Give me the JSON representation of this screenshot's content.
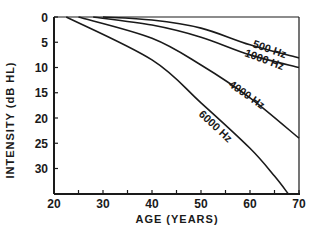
{
  "chart_data": {
    "type": "line",
    "title": "",
    "xlabel": "AGE (YEARS)",
    "ylabel": "INTENSITY (dB HL)",
    "xlim": [
      20,
      70
    ],
    "ylim": [
      0,
      35
    ],
    "y_inverted": true,
    "grid": false,
    "legend": "inline labels on curves",
    "x_ticks": [
      20,
      30,
      40,
      50,
      60,
      70
    ],
    "x_minor_ticks": [
      25,
      35,
      45,
      55,
      65
    ],
    "y_ticks": [
      0,
      5,
      10,
      15,
      20,
      25,
      30
    ],
    "series": [
      {
        "name": "500 Hz",
        "label": "500 Hz",
        "x": [
          30,
          40,
          50,
          60,
          70
        ],
        "y": [
          0,
          0.6,
          2.2,
          5.5,
          8.1
        ]
      },
      {
        "name": "1000 Hz",
        "label": "1000 Hz",
        "x": [
          28,
          40,
          50,
          60,
          70
        ],
        "y": [
          0,
          1.6,
          4.0,
          7.5,
          10.0
        ]
      },
      {
        "name": "4000 Hz",
        "label": "4000 Hz",
        "x": [
          25,
          40,
          50,
          60,
          70
        ],
        "y": [
          0,
          4.2,
          9.5,
          16.0,
          24.0
        ]
      },
      {
        "name": "6000 Hz",
        "label": "6000 Hz",
        "x": [
          22.5,
          40,
          50,
          60,
          65,
          67.8
        ],
        "y": [
          0,
          8.5,
          17.0,
          26.0,
          31.5,
          35.0
        ]
      }
    ]
  },
  "labels": {
    "x_axis_title": "AGE (YEARS)",
    "y_axis_title": "INTENSITY (dB HL)",
    "series": [
      "500 Hz",
      "1000 Hz",
      "4000 Hz",
      "6000 Hz"
    ]
  }
}
